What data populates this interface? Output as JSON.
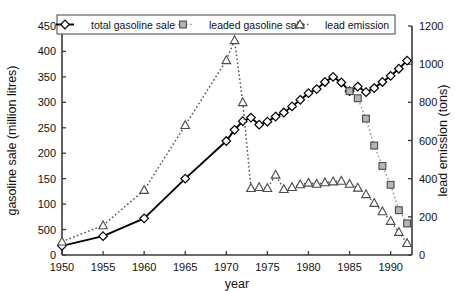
{
  "chart_data": {
    "type": "line",
    "title": "",
    "xlabel": "year",
    "ylabel": "gasoline sale (million litres)",
    "y2label": "lead emission (tons)",
    "xlim": [
      1950,
      1992.6
    ],
    "ylim": [
      0,
      450
    ],
    "y2lim": [
      0,
      1200
    ],
    "xticks": [
      1950,
      1955,
      1960,
      1965,
      1970,
      1975,
      1980,
      1985,
      1990
    ],
    "xticklabels": [
      "1950",
      "1955",
      "1960",
      "1965",
      "1970",
      "1975",
      "1980",
      "1985",
      "1990"
    ],
    "yticks": [
      0,
      50,
      100,
      150,
      200,
      250,
      300,
      350,
      400,
      450
    ],
    "yticklabels": [
      "0",
      "500",
      "100",
      "150",
      "200",
      "250",
      "300",
      "350",
      "400",
      "450"
    ],
    "y2ticks": [
      0,
      200,
      400,
      600,
      800,
      1000,
      1200
    ],
    "y2ticklabels": [
      "0",
      "200",
      "400",
      "600",
      "800",
      "1000",
      "1200"
    ],
    "grid": false,
    "legend_position": "top-center",
    "series": [
      {
        "name": "total gasoline sale",
        "axis": "left",
        "marker": "diamond",
        "line": "solid",
        "color": "#000000",
        "points": [
          [
            1950,
            18
          ],
          [
            1955,
            37
          ],
          [
            1960,
            72
          ],
          [
            1965,
            150
          ],
          [
            1970,
            224
          ],
          [
            1971,
            246
          ],
          [
            1972,
            263
          ],
          [
            1973,
            270
          ],
          [
            1974,
            256
          ],
          [
            1975,
            262
          ],
          [
            1976,
            272
          ],
          [
            1977,
            280
          ],
          [
            1978,
            292
          ],
          [
            1979,
            305
          ],
          [
            1980,
            318
          ],
          [
            1981,
            326
          ],
          [
            1982,
            340
          ],
          [
            1983,
            350
          ],
          [
            1984,
            339
          ],
          [
            1985,
            322
          ],
          [
            1986,
            331
          ],
          [
            1987,
            320
          ],
          [
            1988,
            328
          ],
          [
            1989,
            340
          ],
          [
            1990,
            352
          ],
          [
            1991,
            366
          ],
          [
            1992,
            382
          ],
          [
            1993,
            396
          ],
          [
            1994,
            406
          ],
          [
            1995,
            414
          ],
          [
            1996,
            410
          ]
        ]
      },
      {
        "name": "leaded gasoline sale",
        "axis": "left",
        "marker": "square",
        "line": "dotted",
        "color": "#9a9a9a",
        "points": [
          [
            1985,
            322
          ],
          [
            1986,
            308
          ],
          [
            1987,
            268
          ],
          [
            1988,
            215
          ],
          [
            1989,
            175
          ],
          [
            1990,
            138
          ],
          [
            1991,
            88
          ],
          [
            1992,
            62
          ]
        ]
      },
      {
        "name": "lead emission",
        "axis": "right",
        "marker": "triangle",
        "line": "dotted",
        "color": "#555555",
        "points": [
          [
            1950,
            70
          ],
          [
            1955,
            155
          ],
          [
            1960,
            340
          ],
          [
            1965,
            680
          ],
          [
            1970,
            1020
          ],
          [
            1971,
            1125
          ],
          [
            1972,
            800
          ],
          [
            1973,
            350
          ],
          [
            1974,
            355
          ],
          [
            1975,
            350
          ],
          [
            1976,
            420
          ],
          [
            1977,
            345
          ],
          [
            1978,
            355
          ],
          [
            1979,
            370
          ],
          [
            1980,
            378
          ],
          [
            1981,
            372
          ],
          [
            1982,
            380
          ],
          [
            1983,
            385
          ],
          [
            1984,
            388
          ],
          [
            1985,
            372
          ],
          [
            1986,
            352
          ],
          [
            1987,
            318
          ],
          [
            1988,
            272
          ],
          [
            1989,
            228
          ],
          [
            1990,
            178
          ],
          [
            1991,
            120
          ],
          [
            1992,
            62
          ]
        ]
      }
    ],
    "legend": [
      {
        "label": "total gasoline sale",
        "marker": "diamond",
        "line": "solid",
        "color": "#000000"
      },
      {
        "label": "leaded gasoline sale",
        "marker": "square",
        "line": "dotted",
        "color": "#9a9a9a"
      },
      {
        "label": "lead emission",
        "marker": "triangle",
        "line": "dotted",
        "color": "#555555"
      }
    ]
  }
}
